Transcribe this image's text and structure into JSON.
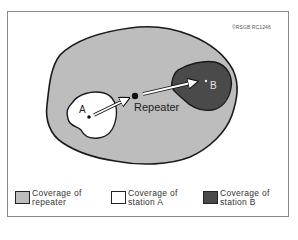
{
  "figure": {
    "copyright": "©RSGB RC1246",
    "labels": {
      "station_a": "A",
      "station_b": "B",
      "repeater": "Repeater"
    }
  },
  "colors": {
    "repeater_coverage": "#bdbdbd",
    "station_a_coverage": "#ffffff",
    "station_b_coverage": "#4a4a4a",
    "outline": "#1a1a1a",
    "frame": "#8a8a8a"
  },
  "legend": {
    "items": [
      {
        "line1": "Coverage of",
        "line2": "repeater",
        "swatch": "light-gray"
      },
      {
        "line1": "Coverage of",
        "line2": "station A",
        "swatch": "white"
      },
      {
        "line1": "Coverage of",
        "line2": "station B",
        "swatch": "dark-gray"
      }
    ]
  }
}
